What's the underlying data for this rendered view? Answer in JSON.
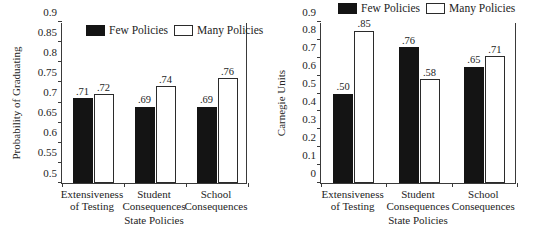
{
  "legend": {
    "few_label": "Few Policies",
    "many_label": "Many Policies",
    "few_color": "#141414",
    "many_color": "#ffffff",
    "many_border": "#2b2b2b"
  },
  "chart_data": [
    {
      "type": "bar",
      "id": "probability-of-graduating",
      "title": "",
      "xlabel": "State Policies",
      "ylabel": "Probability of Graduating",
      "ylim": [
        0.5,
        0.9
      ],
      "ytick_values": [
        0.5,
        0.55,
        0.6,
        0.65,
        0.7,
        0.75,
        0.8,
        0.85,
        0.9
      ],
      "ytick_labels": [
        "0.5",
        "0.55",
        "0.6",
        "0.65",
        "0.7",
        "0.75",
        "0.8",
        "0.85",
        "0.9"
      ],
      "grid": false,
      "legend_position": "top-center-inside",
      "categories": [
        [
          "Extensiveness",
          "of Testing"
        ],
        [
          "Student",
          "Consequences"
        ],
        [
          "School",
          "Consequences"
        ]
      ],
      "series": [
        {
          "name": "Few Policies",
          "values": [
            0.71,
            0.69,
            0.69
          ],
          "labels": [
            ".71",
            ".69",
            ".69"
          ]
        },
        {
          "name": "Many Policies",
          "values": [
            0.72,
            0.74,
            0.76
          ],
          "labels": [
            ".72",
            ".74",
            ".76"
          ]
        }
      ]
    },
    {
      "type": "bar",
      "id": "carnegie-units",
      "title": "",
      "xlabel": "State Policies",
      "ylabel": "Carnegie Units",
      "ylim": [
        0,
        0.9
      ],
      "ytick_values": [
        0,
        0.1,
        0.2,
        0.3,
        0.4,
        0.5,
        0.6,
        0.7,
        0.8,
        0.9
      ],
      "ytick_labels": [
        "0",
        "0.1",
        "0.2",
        "0.3",
        "0.4",
        "0.5",
        "0.6",
        "0.7",
        "0.8",
        "0.9"
      ],
      "grid": false,
      "legend_position": "top-above-axes",
      "categories": [
        [
          "Extensiveness",
          "of Testing"
        ],
        [
          "Student",
          "Consequences"
        ],
        [
          "School",
          "Consequences"
        ]
      ],
      "series": [
        {
          "name": "Few Policies",
          "values": [
            0.5,
            0.76,
            0.65
          ],
          "labels": [
            ".50",
            ".76",
            ".65"
          ]
        },
        {
          "name": "Many Policies",
          "values": [
            0.85,
            0.58,
            0.71
          ],
          "labels": [
            ".85",
            ".58",
            ".71"
          ]
        }
      ]
    }
  ]
}
